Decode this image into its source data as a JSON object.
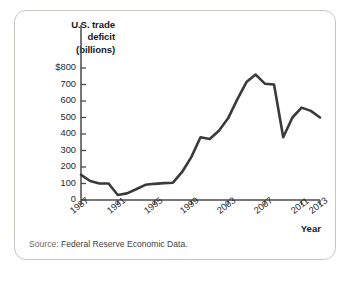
{
  "figure": {
    "title_lines": [
      "U.S. trade",
      "deficit",
      "(billions)"
    ],
    "source_label": "Source:",
    "source_text": " Federal Reserve Economic Data.",
    "xaxis_title": "Year",
    "line_color": "#3a3a3a",
    "axis_color": "#4a4a4a",
    "border_color": "#c9c6c2",
    "text_color": "#1b1b1b"
  },
  "chart_data": {
    "type": "line",
    "title": "U.S. trade deficit (billions)",
    "xlabel": "Year",
    "ylabel": "U.S. trade deficit (billions)",
    "xlim": [
      1987,
      2013
    ],
    "ylim": [
      0,
      800
    ],
    "grid": false,
    "legend": "none",
    "ytick_labels": [
      "$800",
      "700",
      "600",
      "500",
      "400",
      "300",
      "200",
      "100",
      "0"
    ],
    "ytick_values": [
      800,
      700,
      600,
      500,
      400,
      300,
      200,
      100,
      0
    ],
    "xtick_labels": [
      "1987",
      "1991",
      "1995",
      "1999",
      "2003",
      "2007",
      "2011",
      "2013"
    ],
    "xtick_values": [
      1987,
      1991,
      1995,
      1999,
      2003,
      2007,
      2011,
      2013
    ],
    "x": [
      1987,
      1988,
      1989,
      1990,
      1991,
      1992,
      1993,
      1994,
      1995,
      1996,
      1997,
      1998,
      1999,
      2000,
      2001,
      2002,
      2003,
      2004,
      2005,
      2006,
      2007,
      2008,
      2009,
      2010,
      2011,
      2012,
      2013
    ],
    "values": [
      152,
      115,
      100,
      100,
      30,
      40,
      65,
      92,
      98,
      102,
      105,
      170,
      260,
      380,
      370,
      420,
      495,
      610,
      715,
      760,
      705,
      700,
      380,
      500,
      560,
      540,
      500
    ],
    "series": [
      {
        "name": "U.S. trade deficit",
        "values": [
          152,
          115,
          100,
          100,
          30,
          40,
          65,
          92,
          98,
          102,
          105,
          170,
          260,
          380,
          370,
          420,
          495,
          610,
          715,
          760,
          705,
          700,
          380,
          500,
          560,
          540,
          500
        ]
      }
    ]
  }
}
